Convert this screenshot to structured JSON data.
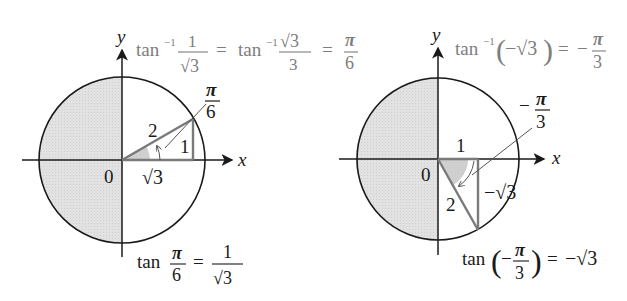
{
  "left_diagram": {
    "y_label": "y",
    "x_label": "x",
    "origin_label": "0",
    "hypotenuse_label": "2",
    "opposite_label": "1",
    "adjacent_label": "√3",
    "angle_label": {
      "num": "π",
      "den": "6"
    },
    "top_formula": {
      "f1": "tan",
      "f1_sup": "−1",
      "f1_num": "1",
      "f1_den": "√3",
      "eq1": "=",
      "f2": "tan",
      "f2_sup": "−1",
      "f2_num": "√3",
      "f2_den": "3",
      "eq2": "=",
      "r_num": "π",
      "r_den": "6"
    },
    "bottom_formula": {
      "tan": "tan",
      "num": "π",
      "den": "6",
      "eq": "=",
      "r_num": "1",
      "r_den": "√3"
    }
  },
  "right_diagram": {
    "y_label": "y",
    "x_label": "x",
    "origin_label": "0",
    "hypotenuse_label": "2",
    "adjacent_label": "1",
    "opposite_label": "−√3",
    "angle_label": {
      "sign": "−",
      "num": "π",
      "den": "3"
    },
    "top_formula": {
      "f": "tan",
      "sup": "−1",
      "lparen": "(",
      "arg": "−√3",
      "rparen": ")",
      "eq": "=",
      "sign": "−",
      "r_num": "π",
      "r_den": "3"
    },
    "bottom_formula": {
      "tan": "tan",
      "lparen": "(",
      "sign": "−",
      "num": "π",
      "den": "3",
      "rparen": ")",
      "eq": "=",
      "result": "−√3"
    }
  },
  "colors": {
    "axis": "#1a1a1a",
    "shade": "#dcdcdc",
    "triangle": "#7a7a7a",
    "formula_gray": "#7d7d7d"
  }
}
